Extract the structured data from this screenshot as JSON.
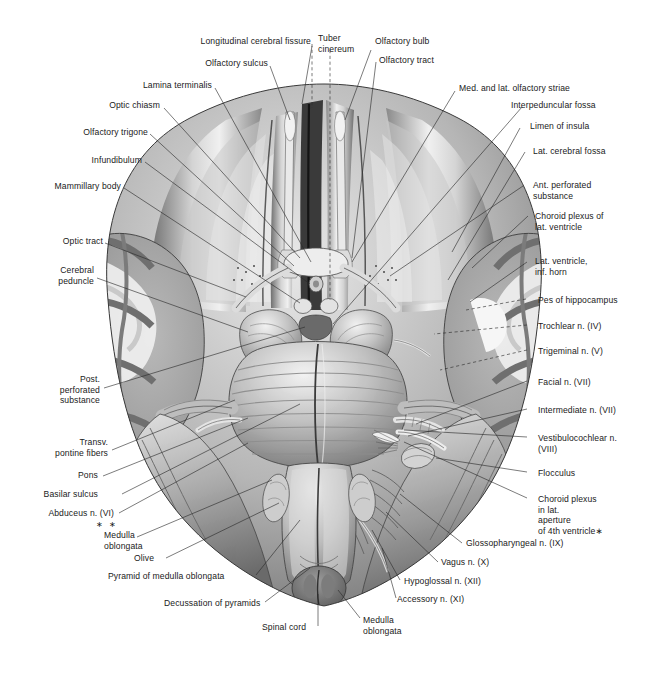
{
  "plate": {
    "title": "Inferior surface (base) of the brain with cranial nerves",
    "width": 647,
    "height": 674,
    "background_color": "#ffffff",
    "line_color": "#2b2b2b",
    "text_color": "#1a1a1a",
    "illustration_style": "grayscale halftone anatomical drawing"
  },
  "footnote_marks": {
    "double_star": "∗ ∗",
    "single_star": "∗"
  },
  "labels_top": [
    {
      "id": "longitudinal-cerebral-fissure",
      "text": "Longitudinal cerebral fissure",
      "align": "right"
    },
    {
      "id": "tuber-cinereum",
      "text": "Tuber\ncinereum",
      "align": "left"
    },
    {
      "id": "olfactory-bulb",
      "text": "Olfactory bulb",
      "align": "left"
    },
    {
      "id": "olfactory-tract",
      "text": "Olfactory tract",
      "align": "left"
    },
    {
      "id": "olfactory-sulcus",
      "text": "Olfactory sulcus",
      "align": "right"
    }
  ],
  "labels_left": [
    {
      "id": "lamina-terminalis",
      "text": "Lamina terminalis"
    },
    {
      "id": "optic-chiasm",
      "text": "Optic chiasm"
    },
    {
      "id": "olfactory-trigone",
      "text": "Olfactory trigone"
    },
    {
      "id": "infundibulum",
      "text": "Infundibulum"
    },
    {
      "id": "mammillary-body",
      "text": "Mammillary body"
    },
    {
      "id": "optic-tract",
      "text": "Optic tract"
    },
    {
      "id": "cerebral-peduncle",
      "text": "Cerebral\npeduncle"
    },
    {
      "id": "post-perforated-substance",
      "text": "Post.\nperforated\nsubstance"
    },
    {
      "id": "transv-pontine-fibers",
      "text": "Transv.\npontine fibers"
    },
    {
      "id": "pons",
      "text": "Pons"
    },
    {
      "id": "basilar-sulcus",
      "text": "Basilar sulcus"
    },
    {
      "id": "abducens-n-vi",
      "text": "Abduceus n. (VI)"
    }
  ],
  "labels_right": [
    {
      "id": "med-and-lat-olfactory-striae",
      "text": "Med. and lat. olfactory striae"
    },
    {
      "id": "interpeduncular-fossa",
      "text": "Interpeduncular fossa"
    },
    {
      "id": "limen-of-insula",
      "text": "Limen of insula"
    },
    {
      "id": "lat-cerebral-fossa",
      "text": "Lat. cerebral fossa"
    },
    {
      "id": "ant-perforated-substance",
      "text": "Ant. perforated\nsubstance"
    },
    {
      "id": "choroid-plexus-of-lat-ventricle",
      "text": "Choroid plexus of\nlat. ventricle"
    },
    {
      "id": "lat-ventricle-inf-horn",
      "text": "Lat. ventricle,\ninf. horn"
    },
    {
      "id": "pes-of-hippocampus",
      "text": "Pes of hippocampus"
    },
    {
      "id": "trochlear-n-iv",
      "text": "Trochlear n. (IV)"
    },
    {
      "id": "trigeminal-n-v",
      "text": "Trigeminal n. (V)"
    },
    {
      "id": "facial-n-vii",
      "text": "Facial n. (VII)"
    },
    {
      "id": "intermediate-n-vii",
      "text": "Intermediate n. (VII)"
    },
    {
      "id": "vestibulocochlear-n-viii",
      "text": "Vestibulocochlear n.\n(VIII)"
    },
    {
      "id": "flocculus",
      "text": "Flocculus"
    },
    {
      "id": "choroid-plexus-in-lat-aperture",
      "text": "Choroid plexus\nin lat.\naperture\nof 4th ventricle∗"
    }
  ],
  "labels_bottom": [
    {
      "id": "medulla-oblongata-left",
      "text": "Medulla\noblongata"
    },
    {
      "id": "olive",
      "text": "Olive"
    },
    {
      "id": "pyramid-of-medulla-oblongata",
      "text": "Pyramid of medulla oblongata"
    },
    {
      "id": "decussation-of-pyramids",
      "text": "Decussation of pyramids"
    },
    {
      "id": "spinal-cord",
      "text": "Spinal cord"
    },
    {
      "id": "medulla-oblongata-right",
      "text": "Medulla\noblongata"
    },
    {
      "id": "glossopharyngeal-n-ix",
      "text": "Glossopharyngeal n. (IX)"
    },
    {
      "id": "vagus-n-x",
      "text": "Vagus n. (X)"
    },
    {
      "id": "hypoglossal-n-xii",
      "text": "Hypoglossal n. (XII)"
    },
    {
      "id": "accessory-n-xi",
      "text": "Accessory n. (XI)"
    }
  ]
}
